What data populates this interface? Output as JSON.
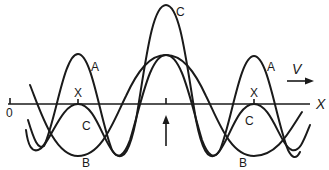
{
  "figure": {
    "type": "wave superposition diagram",
    "axis": {
      "origin_label": "0",
      "axis_label": "X",
      "center_marker": "up-arrow"
    },
    "velocity": {
      "label": "V",
      "direction": "right-arrow"
    },
    "curves": [
      {
        "name": "A",
        "labels": [
          "A",
          "A"
        ]
      },
      {
        "name": "B",
        "labels": [
          "B",
          "B"
        ]
      },
      {
        "name": "C",
        "labels": [
          "C",
          "C",
          "C"
        ]
      }
    ],
    "points": [
      {
        "label": "X"
      },
      {
        "label": "X"
      }
    ],
    "labels": {
      "A_left": "A",
      "A_right": "A",
      "B_left": "B",
      "B_right": "B",
      "C_top": "C",
      "C_left": "C",
      "C_right": "C",
      "X_left": "X",
      "X_right": "X",
      "origin": "0",
      "axis": "X",
      "velocity": "V"
    }
  }
}
